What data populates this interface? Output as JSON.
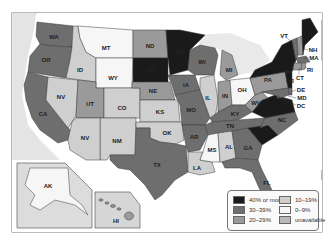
{
  "map": {
    "colors": {
      "40plus": "#1a1a1a",
      "30_39": "#6e6e6e",
      "20_29": "#9a9a9a",
      "10_19": "#cfcfcf",
      "0_9": "#f6f6f6",
      "unavailable": "#b9b9b9",
      "water": "#e4e4e4",
      "land_other": "#e9e9e9"
    },
    "states": [
      {
        "abbr": "WA",
        "cat": "30_39"
      },
      {
        "abbr": "OR",
        "cat": "30_39"
      },
      {
        "abbr": "CA",
        "cat": "30_39"
      },
      {
        "abbr": "ID",
        "cat": "10_19"
      },
      {
        "abbr": "NV",
        "cat": "10_19"
      },
      {
        "abbr": "MT",
        "cat": "0_9"
      },
      {
        "abbr": "WY",
        "cat": "0_9"
      },
      {
        "abbr": "UT",
        "cat": "20_29"
      },
      {
        "abbr": "CO",
        "cat": "10_19"
      },
      {
        "abbr": "NM",
        "cat": "10_19"
      },
      {
        "abbr": "ND",
        "cat": "20_29"
      },
      {
        "abbr": "SD",
        "cat": "40plus"
      },
      {
        "abbr": "NE",
        "cat": "20_29"
      },
      {
        "abbr": "KS",
        "cat": "10_19"
      },
      {
        "abbr": "OK",
        "cat": "10_19"
      },
      {
        "abbr": "TX",
        "cat": "30_39"
      },
      {
        "abbr": "MN",
        "cat": "40plus"
      },
      {
        "abbr": "IA",
        "cat": "30_39"
      },
      {
        "abbr": "MO",
        "cat": "30_39"
      },
      {
        "abbr": "AR",
        "cat": "30_39"
      },
      {
        "abbr": "LA",
        "cat": "10_19"
      },
      {
        "abbr": "WI",
        "cat": "30_39"
      },
      {
        "abbr": "IL",
        "cat": "10_19"
      },
      {
        "abbr": "MI",
        "cat": "20_29"
      },
      {
        "abbr": "IN",
        "cat": "20_29"
      },
      {
        "abbr": "OH",
        "cat": "0_9"
      },
      {
        "abbr": "KY",
        "cat": "30_39"
      },
      {
        "abbr": "TN",
        "cat": "30_39"
      },
      {
        "abbr": "MS",
        "cat": "0_9"
      },
      {
        "abbr": "AL",
        "cat": "10_19"
      },
      {
        "abbr": "GA",
        "cat": "30_39"
      },
      {
        "abbr": "FL",
        "cat": "30_39"
      },
      {
        "abbr": "SC",
        "cat": "40plus"
      },
      {
        "abbr": "NC",
        "cat": "30_39"
      },
      {
        "abbr": "VA",
        "cat": "40plus"
      },
      {
        "abbr": "WV",
        "cat": "20_29"
      },
      {
        "abbr": "PA",
        "cat": "20_29"
      },
      {
        "abbr": "NY",
        "cat": "40plus"
      },
      {
        "abbr": "VT",
        "cat": "30_39"
      },
      {
        "abbr": "NH",
        "cat": "20_29"
      },
      {
        "abbr": "ME",
        "cat": "40plus"
      },
      {
        "abbr": "MA",
        "cat": "30_39"
      },
      {
        "abbr": "RI",
        "cat": "20_29"
      },
      {
        "abbr": "CT",
        "cat": "20_29"
      },
      {
        "abbr": "NJ",
        "cat": "40plus"
      },
      {
        "abbr": "DE",
        "cat": "30_39"
      },
      {
        "abbr": "MD",
        "cat": "30_39"
      },
      {
        "abbr": "DC",
        "cat": "30_39"
      },
      {
        "abbr": "AK",
        "cat": "0_9"
      },
      {
        "abbr": "HI",
        "cat": "20_29"
      }
    ]
  },
  "legend": {
    "items": [
      {
        "key": "40plus",
        "label": "40% or more"
      },
      {
        "key": "30_39",
        "label": "30–39%"
      },
      {
        "key": "20_29",
        "label": "20–29%"
      },
      {
        "key": "10_19",
        "label": "10–19%"
      },
      {
        "key": "0_9",
        "label": "0–9%"
      },
      {
        "key": "unavailable",
        "label": "unavailable"
      }
    ]
  },
  "labels": {
    "WA": "WA",
    "OR": "OR",
    "CA": "CA",
    "ID": "ID",
    "NV": "NV",
    "MT": "MT",
    "WY": "WY",
    "UT": "UT",
    "CO": "CO",
    "NM": "NM",
    "ND": "ND",
    "SD": "SD",
    "NE": "NE",
    "KS": "KS",
    "OK": "OK",
    "TX": "TX",
    "MN": "MN",
    "IA": "IA",
    "MO": "MO",
    "AR": "AR",
    "LA": "LA",
    "WI": "WI",
    "IL": "IL",
    "MI": "MI",
    "IN": "IN",
    "OH": "OH",
    "KY": "KY",
    "TN": "TN",
    "MS": "MS",
    "AL": "AL",
    "GA": "GA",
    "FL": "FL",
    "SC": "SC",
    "NC": "NC",
    "VA": "VA",
    "WV": "WV",
    "PA": "PA",
    "NY": "NY",
    "VT": "VT",
    "NH": "NH",
    "ME": "ME",
    "MA": "MA",
    "RI": "RI",
    "CT": "CT",
    "NJ": "NJ",
    "DE": "DE",
    "MD": "MD",
    "DC": "DC",
    "AK": "AK",
    "HI": "HI",
    "NV2": "NV"
  }
}
